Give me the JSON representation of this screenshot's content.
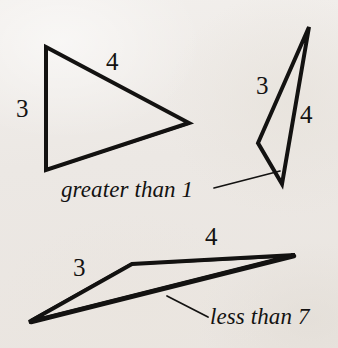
{
  "figure": {
    "caption_text": "",
    "background_color": "#eeeae6",
    "ink_color": "#131211",
    "stroke_width": 4,
    "thin_stroke_width": 1.6,
    "width": 338,
    "height": 348,
    "triangles": [
      {
        "name": "triangle-top-left",
        "vertices": [
          [
            46,
            47
          ],
          [
            189,
            123
          ],
          [
            46,
            170
          ]
        ],
        "side_labels": [
          {
            "name": "side-label-3",
            "text": "3"
          },
          {
            "name": "side-label-4",
            "text": "4"
          }
        ]
      },
      {
        "name": "triangle-top-right",
        "vertices": [
          [
            309,
            27
          ],
          [
            282,
            184
          ],
          [
            258,
            143
          ]
        ],
        "side_labels": [
          {
            "name": "side-label-3",
            "text": "3"
          },
          {
            "name": "side-label-4",
            "text": "4"
          }
        ]
      },
      {
        "name": "triangle-bottom",
        "vertices": [
          [
            29,
            322
          ],
          [
            132,
            264
          ],
          [
            295,
            255
          ]
        ],
        "side_labels": [
          {
            "name": "side-label-3",
            "text": "3"
          },
          {
            "name": "side-label-4",
            "text": "4"
          }
        ]
      }
    ],
    "labels": {
      "t1_side3": "3",
      "t1_side4": "4",
      "t2_side3": "3",
      "t2_side4": "4",
      "t3_side3": "3",
      "t3_side4": "4"
    },
    "annotations": [
      {
        "name": "annotation-greater-than-1",
        "text": "greater than 1",
        "leader_line": {
          "from": [
            214,
            188
          ],
          "to": [
            280,
            171
          ]
        }
      },
      {
        "name": "annotation-less-than-7",
        "text": "less than 7",
        "leader_line": {
          "from": [
            167,
            296
          ],
          "to": [
            208,
            317
          ]
        }
      }
    ],
    "annotation_text": {
      "greater_than": "greater than 1",
      "less_than": "less than 7"
    }
  }
}
